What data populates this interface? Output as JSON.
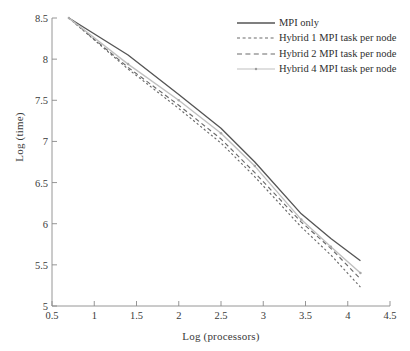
{
  "chart_data": {
    "type": "line",
    "title": "",
    "subtitle": "",
    "xlabel": "Log (processors)",
    "ylabel": "Log (time)",
    "xlim": [
      0.5,
      4.5
    ],
    "ylim": [
      5,
      8.5
    ],
    "xticks": [
      0.5,
      1,
      1.5,
      2,
      2.5,
      3,
      3.5,
      4,
      4.5
    ],
    "xtick_labels": [
      "0.5",
      "1",
      "1.5",
      "2",
      "2.5",
      "3",
      "3.5",
      "4",
      "4.5"
    ],
    "yticks": [
      5,
      5.5,
      6,
      6.5,
      7,
      7.5,
      8,
      8.5
    ],
    "ytick_labels": [
      "5",
      "5.5",
      "6",
      "6.5",
      "7",
      "7.5",
      "8",
      "8.5"
    ],
    "grid": false,
    "legend_position": "top-right",
    "series": [
      {
        "name": "MPI only",
        "style": "solid",
        "color": "#555555",
        "marker": "none",
        "x": [
          0.7,
          1.4,
          2.0,
          2.5,
          2.9,
          3.45,
          3.8,
          4.15
        ],
        "y": [
          8.5,
          8.05,
          7.57,
          7.16,
          6.75,
          6.12,
          5.82,
          5.55
        ]
      },
      {
        "name": "Hybrid 1 MPI task per node",
        "style": "dotted",
        "color": "#6b6b6b",
        "marker": "none",
        "x": [
          0.7,
          1.4,
          2.0,
          2.5,
          2.9,
          3.45,
          3.8,
          4.15
        ],
        "y": [
          8.5,
          7.88,
          7.4,
          6.98,
          6.57,
          5.96,
          5.62,
          5.23
        ]
      },
      {
        "name": "Hybrid 2 MPI task per node",
        "style": "dashed",
        "color": "#6b6b6b",
        "marker": "none",
        "x": [
          0.7,
          1.4,
          2.0,
          2.5,
          2.9,
          3.45,
          3.8,
          4.15
        ],
        "y": [
          8.5,
          7.9,
          7.44,
          7.03,
          6.62,
          6.02,
          5.7,
          5.33
        ]
      },
      {
        "name": "Hybrid 4 MPI task per node",
        "style": "solid-light-marked",
        "color": "#c0c0c0",
        "marker": "dot",
        "x": [
          0.7,
          1.4,
          2.0,
          2.5,
          2.9,
          3.45,
          3.8,
          4.15
        ],
        "y": [
          8.5,
          7.94,
          7.5,
          7.1,
          6.7,
          6.05,
          5.72,
          5.4
        ]
      }
    ]
  },
  "legend": {
    "items": [
      {
        "label": "MPI only"
      },
      {
        "label": "Hybrid 1 MPI task per node"
      },
      {
        "label": "Hybrid 2 MPI task per node"
      },
      {
        "label": "Hybrid 4 MPI task per node"
      }
    ]
  }
}
